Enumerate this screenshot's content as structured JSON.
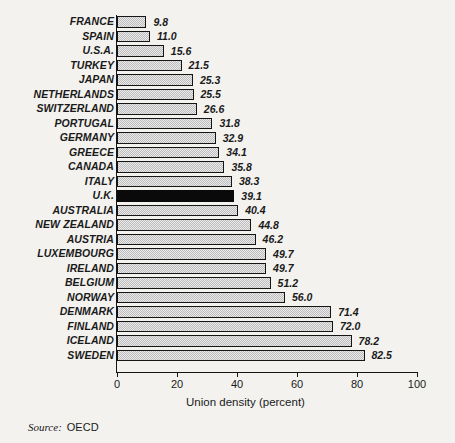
{
  "chart_data": {
    "type": "bar",
    "orientation": "horizontal",
    "title": "",
    "xlabel": "Union density (percent)",
    "ylabel": "",
    "xlim": [
      0,
      100
    ],
    "xticks": [
      0,
      20,
      40,
      60,
      80,
      100
    ],
    "grid": false,
    "legend": null,
    "highlight_category": "U.K.",
    "highlight_color": "#0a0a0a",
    "bar_fill_color": "#c9c9c9",
    "bar_edge_color": "#151515",
    "categories": [
      "FRANCE",
      "SPAIN",
      "U.S.A.",
      "TURKEY",
      "JAPAN",
      "NETHERLANDS",
      "SWITZERLAND",
      "PORTUGAL",
      "GERMANY",
      "GREECE",
      "CANADA",
      "ITALY",
      "U.K.",
      "AUSTRALIA",
      "NEW ZEALAND",
      "AUSTRIA",
      "LUXEMBOURG",
      "IRELAND",
      "BELGIUM",
      "NORWAY",
      "DENMARK",
      "FINLAND",
      "ICELAND",
      "SWEDEN"
    ],
    "values": [
      9.8,
      11.0,
      15.6,
      21.5,
      25.3,
      25.5,
      26.6,
      31.8,
      32.9,
      34.1,
      35.8,
      38.3,
      39.1,
      40.4,
      44.8,
      46.2,
      49.7,
      49.7,
      51.2,
      56.0,
      71.4,
      72.0,
      78.2,
      82.5
    ],
    "value_labels": [
      "9.8",
      "11.0",
      "15.6",
      "21.5",
      "25.3",
      "25.5",
      "26.6",
      "31.8",
      "32.9",
      "34.1",
      "35.8",
      "38.3",
      "39.1",
      "40.4",
      "44.8",
      "46.2",
      "49.7",
      "49.7",
      "51.2",
      "56.0",
      "71.4",
      "72.0",
      "78.2",
      "82.5"
    ]
  },
  "source": {
    "label": "Source:",
    "value": "OECD"
  }
}
